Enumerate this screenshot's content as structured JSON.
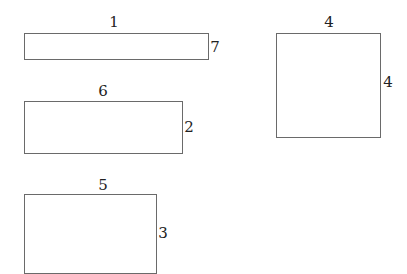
{
  "diagram": {
    "type": "rectangles-with-dimensions",
    "shapes": [
      {
        "id": "rect-a",
        "width_label": "1",
        "height_label": "7",
        "x": 24,
        "y": 33,
        "w": 185,
        "h": 27
      },
      {
        "id": "rect-b",
        "width_label": "6",
        "height_label": "2",
        "x": 24,
        "y": 101,
        "w": 159,
        "h": 53
      },
      {
        "id": "rect-c",
        "width_label": "5",
        "height_label": "3",
        "x": 24,
        "y": 194,
        "w": 133,
        "h": 80
      },
      {
        "id": "rect-d",
        "width_label": "4",
        "height_label": "4",
        "x": 276,
        "y": 33,
        "w": 105,
        "h": 105
      }
    ]
  }
}
